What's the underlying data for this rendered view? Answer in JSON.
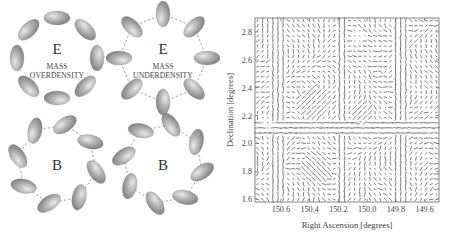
{
  "figure": {
    "panels": [
      {
        "id": "e-over",
        "mode_label": "E",
        "caption_lines": [
          "MASS",
          "OVERDENSITY"
        ],
        "cx": 57,
        "cy": 58,
        "r": 40,
        "pattern": "tangential",
        "n": 8,
        "connectors": false
      },
      {
        "id": "e-under",
        "mode_label": "E",
        "caption_lines": [
          "MASS",
          "UNDERDENSITY"
        ],
        "cx": 163,
        "cy": 58,
        "r": 44,
        "pattern": "radial",
        "n": 8,
        "connectors": true
      },
      {
        "id": "b-left",
        "mode_label": "B",
        "caption_lines": [],
        "cx": 57,
        "cy": 164,
        "r": 40,
        "pattern": "curl-left",
        "n": 8,
        "connectors": true
      },
      {
        "id": "b-right",
        "mode_label": "B",
        "caption_lines": [],
        "cx": 163,
        "cy": 164,
        "r": 40,
        "pattern": "curl-right",
        "n": 8,
        "connectors": true
      }
    ]
  },
  "chart_data": {
    "type": "scatter",
    "title": "",
    "subtitle": "Weak lensing shear field (whisker plot)",
    "xlabel": "Right Ascension [degrees]",
    "ylabel": "Declination [degrees]",
    "xlim": [
      150.78,
      149.5
    ],
    "ylim": [
      1.58,
      2.9
    ],
    "x_ticks": [
      150.6,
      150.4,
      150.2,
      150.0,
      149.8,
      149.6
    ],
    "x_tick_labels": [
      "150.6",
      "150.4",
      "150.2",
      "150.0",
      "149.8",
      "149.6"
    ],
    "y_ticks": [
      1.6,
      1.8,
      2.0,
      2.2,
      2.4,
      2.6,
      2.8
    ],
    "y_tick_labels": [
      "1.6",
      "1.8",
      "2.0",
      "2.2",
      "2.4",
      "2.6",
      "2.8"
    ],
    "grid": false,
    "legend": null,
    "x_axis_inverted": true,
    "grid_resolution": [
      36,
      36
    ]
  },
  "plot_frame": {
    "left": 255,
    "top": 18,
    "right": 439,
    "bottom": 202
  }
}
